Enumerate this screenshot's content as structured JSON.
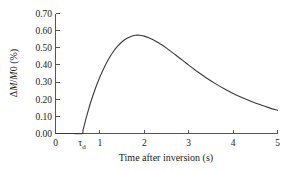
{
  "figure": {
    "background_color": "#ffffff",
    "axis_color": "#555555",
    "curve_color": "#3a3a3a"
  },
  "axes": {
    "y_title_parts": {
      "delta": "Δ",
      "m_italic": "M",
      "slash": "/",
      "m0_italic": "M",
      "zero": "0",
      "unit": " (%)"
    },
    "y_title_full": "ΔM/M0 (%)",
    "x_title": "Time after inversion (s)"
  },
  "chart_data": {
    "type": "line",
    "title": "",
    "subtitle": "",
    "xlabel": "Time after inversion (s)",
    "ylabel": "ΔM/M0 (%)",
    "xlim": [
      0,
      5
    ],
    "ylim": [
      0.0,
      0.7
    ],
    "grid": false,
    "legend": false,
    "legend_position": "none",
    "x_ticks": [
      0,
      1,
      2,
      3,
      4,
      5
    ],
    "x_tick_labels": [
      "0",
      "1",
      "2",
      "3",
      "4",
      "5"
    ],
    "x_special_ticks": [
      {
        "value": 0.6,
        "label": "τ",
        "subscript": "d",
        "description": "delay-time marker tau-d where signal onset occurs"
      }
    ],
    "y_ticks": [
      0.0,
      0.1,
      0.2,
      0.3,
      0.4,
      0.5,
      0.6,
      0.7
    ],
    "y_tick_labels": [
      "0.00",
      "0.10",
      "0.20",
      "0.30",
      "0.40",
      "0.50",
      "0.60",
      "0.70"
    ],
    "tick_direction": "in",
    "spines_visible": [
      "left",
      "bottom"
    ],
    "series": [
      {
        "name": "ΔM/M0",
        "color": "#3a3a3a",
        "line_width": 1.1,
        "x": [
          0.0,
          0.2,
          0.4,
          0.6,
          0.62,
          0.66,
          0.7,
          0.75,
          0.8,
          0.9,
          1.0,
          1.1,
          1.2,
          1.3,
          1.4,
          1.5,
          1.6,
          1.7,
          1.8,
          1.85,
          1.9,
          2.0,
          2.1,
          2.2,
          2.3,
          2.4,
          2.5,
          2.6,
          2.7,
          2.8,
          2.9,
          3.0,
          3.2,
          3.4,
          3.6,
          3.8,
          4.0,
          4.2,
          4.4,
          4.6,
          4.8,
          5.0
        ],
        "y": [
          0.0,
          0.0,
          0.0,
          0.0,
          0.02,
          0.06,
          0.1,
          0.145,
          0.188,
          0.264,
          0.33,
          0.387,
          0.436,
          0.477,
          0.509,
          0.535,
          0.554,
          0.566,
          0.573,
          0.574,
          0.573,
          0.568,
          0.559,
          0.547,
          0.532,
          0.516,
          0.498,
          0.479,
          0.459,
          0.439,
          0.419,
          0.399,
          0.36,
          0.324,
          0.291,
          0.261,
          0.234,
          0.21,
          0.188,
          0.169,
          0.151,
          0.135
        ]
      }
    ],
    "annotations": [
      {
        "text": "τd",
        "x": 0.6,
        "y": 0.0,
        "note": "onset of the recovery curve at the delay time"
      }
    ],
    "peak": {
      "x": 1.85,
      "y": 0.574
    }
  }
}
